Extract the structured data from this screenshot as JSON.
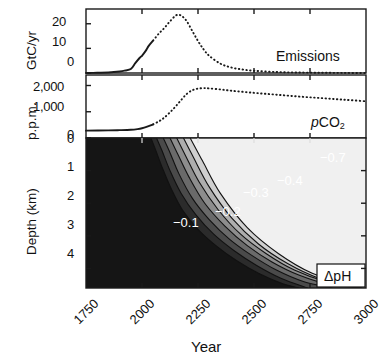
{
  "figure": {
    "xlabel": "Year",
    "x_ticks": [
      "1750",
      "2000",
      "2250",
      "2500",
      "2750",
      "3000"
    ],
    "x_range": [
      1750,
      3000
    ]
  },
  "panels": {
    "emissions": {
      "tag": "Emissions",
      "ylabel": "GtC/yr",
      "y_ticks": [
        "0",
        "10",
        "20"
      ],
      "ylim": [
        0,
        26
      ]
    },
    "pco2": {
      "tag_main": "CO",
      "tag_prefix": "p",
      "tag_sub": "2",
      "ylabel": "p.p.m.",
      "y_ticks": [
        "0",
        "1,000",
        "2,000"
      ],
      "ylim": [
        0,
        2400
      ]
    },
    "dph": {
      "tag": "ΔpH",
      "ylabel": "Depth (km)",
      "y_ticks": [
        "0",
        "1",
        "2",
        "3",
        "4"
      ],
      "ylim": [
        0,
        4.6
      ]
    }
  },
  "contour_labels": [
    {
      "text": "−0.1",
      "x": 173,
      "y": 215
    },
    {
      "text": "−0.2",
      "x": 215,
      "y": 204
    },
    {
      "text": "−0.3",
      "x": 243,
      "y": 185
    },
    {
      "text": "−0.4",
      "x": 277,
      "y": 173
    },
    {
      "text": "−0.7",
      "x": 320,
      "y": 150
    }
  ],
  "colors": {
    "line": "#1a1a1a",
    "frame": "#1a1a1a",
    "background": "#ffffff",
    "contour_label": "#ffffff",
    "band_darkest": "#151515",
    "band_lightest": "#f2f2f2"
  },
  "chart_data": {
    "type": "line",
    "title": "",
    "xlabel": "Year",
    "charts": [
      {
        "name": "Emissions",
        "type": "line",
        "ylabel": "GtC/yr",
        "ylim": [
          0,
          26
        ],
        "xlim": [
          1750,
          3000
        ],
        "solid_until": 2050,
        "x": [
          1750,
          1800,
          1850,
          1900,
          1925,
          1950,
          1970,
          1990,
          2000,
          2010,
          2020,
          2030,
          2050,
          2075,
          2100,
          2125,
          2150,
          2165,
          2180,
          2200,
          2225,
          2250,
          2275,
          2300,
          2350,
          2400,
          2450,
          2500,
          2600,
          2700,
          2800,
          2900,
          3000
        ],
        "y": [
          0.0,
          0.1,
          0.2,
          0.6,
          1.0,
          1.6,
          4.0,
          6.2,
          7.0,
          8.2,
          9.5,
          11.0,
          13.2,
          16.0,
          18.3,
          21.0,
          23.3,
          23.6,
          23.0,
          21.0,
          17.0,
          13.0,
          9.6,
          7.0,
          3.8,
          2.2,
          1.4,
          0.9,
          0.4,
          0.2,
          0.1,
          0.05,
          0.0
        ]
      },
      {
        "name": "pCO2",
        "type": "line",
        "ylabel": "p.p.m.",
        "ylim": [
          0,
          2400
        ],
        "xlim": [
          1750,
          3000
        ],
        "solid_until": 2050,
        "x": [
          1750,
          1850,
          1900,
          1950,
          1980,
          2000,
          2020,
          2050,
          2080,
          2100,
          2125,
          2150,
          2175,
          2200,
          2225,
          2250,
          2275,
          2300,
          2350,
          2400,
          2500,
          2600,
          2700,
          2800,
          2900,
          3000
        ],
        "y": [
          280,
          290,
          300,
          315,
          340,
          370,
          420,
          520,
          660,
          780,
          980,
          1200,
          1450,
          1680,
          1820,
          1880,
          1900,
          1890,
          1850,
          1800,
          1720,
          1650,
          1580,
          1520,
          1460,
          1400
        ]
      },
      {
        "name": "Delta pH",
        "type": "contour",
        "ylabel": "Depth (km)",
        "ylim": [
          0,
          4.6
        ],
        "xlim": [
          1750,
          3000
        ],
        "levels": [
          -0.1,
          -0.2,
          -0.3,
          -0.4,
          -0.5,
          -0.6,
          -0.7
        ],
        "colorbar": "grayscale: dark = near zero change, light = strong negative"
      }
    ]
  }
}
